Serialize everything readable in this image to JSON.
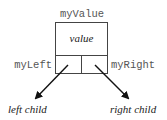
{
  "diagram": {
    "node_label": "myValue",
    "value_label": "value",
    "left_pointer_label": "myLeft",
    "right_pointer_label": "myRight",
    "left_target_label": "left child",
    "right_target_label": "right child",
    "colors": {
      "line": "#444444",
      "arrow": "#111111",
      "mono_text": "#555555",
      "italic_text": "#222222"
    }
  }
}
